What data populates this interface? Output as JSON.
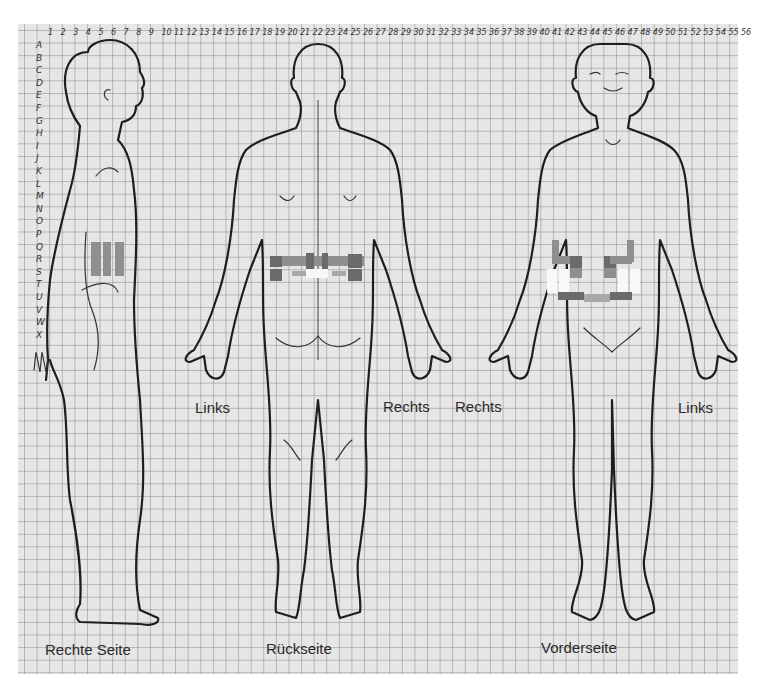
{
  "grid": {
    "column_labels": [
      "1",
      "2",
      "3",
      "4",
      "5",
      "6",
      "7",
      "8",
      "9",
      "10",
      "11",
      "12",
      "13",
      "14",
      "15",
      "16",
      "17",
      "18",
      "19",
      "20",
      "21",
      "22",
      "23",
      "24",
      "25",
      "26",
      "27",
      "28",
      "29",
      "30",
      "31",
      "32",
      "33",
      "34",
      "35",
      "36",
      "37",
      "38",
      "39",
      "40",
      "41",
      "42",
      "43",
      "44",
      "45",
      "46",
      "47",
      "48",
      "49",
      "50",
      "51",
      "52",
      "53",
      "54",
      "55",
      "56"
    ],
    "row_labels": [
      "A",
      "B",
      "C",
      "D",
      "E",
      "F",
      "G",
      "H",
      "I",
      "J",
      "K",
      "L",
      "M",
      "N",
      "O",
      "P",
      "Q",
      "R",
      "S",
      "T",
      "U",
      "V",
      "W",
      "X"
    ]
  },
  "figures": [
    {
      "id": "right-side",
      "caption": "Rechte Seite"
    },
    {
      "id": "back",
      "caption": "Rückseite",
      "left_label": "Links",
      "right_label": "Rechts"
    },
    {
      "id": "front",
      "caption": "Vorderseite",
      "left_label": "Rechts",
      "right_label": "Links"
    }
  ],
  "shading_colors": {
    "dark": "#6a6a6a",
    "medium": "#8f8f8f",
    "light": "#a8a8a8",
    "white": "#f8f8f8"
  },
  "pain_regions": {
    "right-side": [
      {
        "shade": "medium",
        "cells": "lower back flank, rows P–S, cols 6–9"
      }
    ],
    "back": [
      {
        "shade": "dark",
        "cells": "lumbar band, row Q"
      },
      {
        "shade": "medium",
        "cells": "lumbar band, row R"
      }
    ],
    "front": [
      {
        "shade": "medium",
        "cells": "lower abdomen, rows P–S"
      },
      {
        "shade": "white",
        "cells": "iliac region, rows R–S"
      }
    ]
  }
}
